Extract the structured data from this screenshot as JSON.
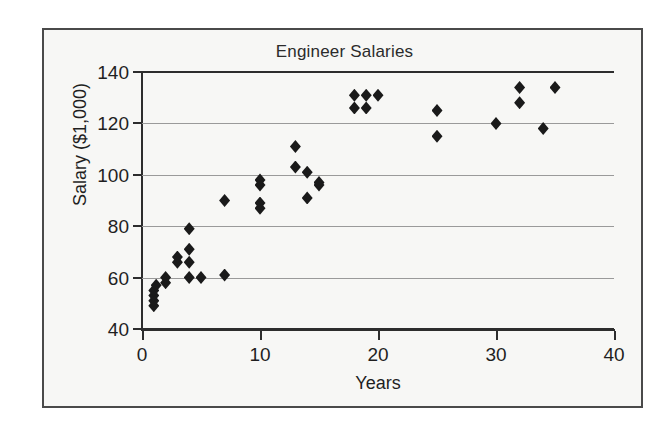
{
  "figure": {
    "title": "Engineer Salaries",
    "frame": "bordered-figure-box"
  },
  "chart_data": {
    "type": "scatter",
    "title": "Engineer Salaries",
    "xlabel": "Years",
    "ylabel": "Salary ($1,000)",
    "xlim": [
      0,
      40
    ],
    "ylim": [
      40,
      140
    ],
    "xticks": [
      0,
      10,
      20,
      30,
      40
    ],
    "yticks": [
      40,
      60,
      80,
      100,
      120,
      140
    ],
    "xtick_labels": [
      "0",
      "10",
      "20",
      "30",
      "40"
    ],
    "ytick_labels": [
      "40",
      "60",
      "80",
      "100",
      "120",
      "140"
    ],
    "grid": "horizontal",
    "legend": "none",
    "marker": "diamond",
    "marker_color": "#1a1a1a",
    "series": [
      {
        "name": "Engineers",
        "points": [
          [
            1.0,
            49
          ],
          [
            1.0,
            51
          ],
          [
            1.0,
            53
          ],
          [
            1.0,
            55
          ],
          [
            1.2,
            57
          ],
          [
            2.0,
            58
          ],
          [
            2.0,
            60
          ],
          [
            3.0,
            66
          ],
          [
            3.0,
            68
          ],
          [
            4.0,
            60
          ],
          [
            4.0,
            66
          ],
          [
            4.0,
            71
          ],
          [
            4.0,
            79
          ],
          [
            5.0,
            60
          ],
          [
            7.0,
            61
          ],
          [
            7.0,
            90
          ],
          [
            10.0,
            87
          ],
          [
            10.0,
            89
          ],
          [
            10.0,
            96
          ],
          [
            10.0,
            98
          ],
          [
            13.0,
            103
          ],
          [
            13.0,
            111
          ],
          [
            14.0,
            91
          ],
          [
            14.0,
            101
          ],
          [
            15.0,
            96
          ],
          [
            15.0,
            97
          ],
          [
            18.0,
            126
          ],
          [
            18.0,
            131
          ],
          [
            19.0,
            126
          ],
          [
            19.0,
            131
          ],
          [
            20.0,
            131
          ],
          [
            25.0,
            115
          ],
          [
            25.0,
            125
          ],
          [
            30.0,
            120
          ],
          [
            32.0,
            128
          ],
          [
            32.0,
            134
          ],
          [
            34.0,
            118
          ],
          [
            35.0,
            134
          ]
        ]
      }
    ]
  }
}
